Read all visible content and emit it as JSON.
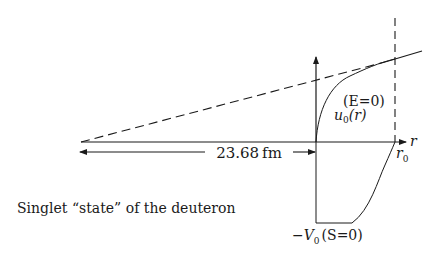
{
  "diagram": {
    "caption": "Singlet “state” of the deuteron",
    "distance_label": "23.68 fm",
    "axis_label": "r",
    "radius_label": {
      "base": "r",
      "sub": "0"
    },
    "wavefunction_label": {
      "base": "u",
      "sub": "0",
      "arg": "(r)"
    },
    "energy_label": "(E=0)",
    "potential_label": {
      "prefix": "−V",
      "sub": "0",
      "suffix": "(S=0)"
    }
  },
  "colors": {
    "ink": "#1a1a1a",
    "background": "#ffffff"
  }
}
